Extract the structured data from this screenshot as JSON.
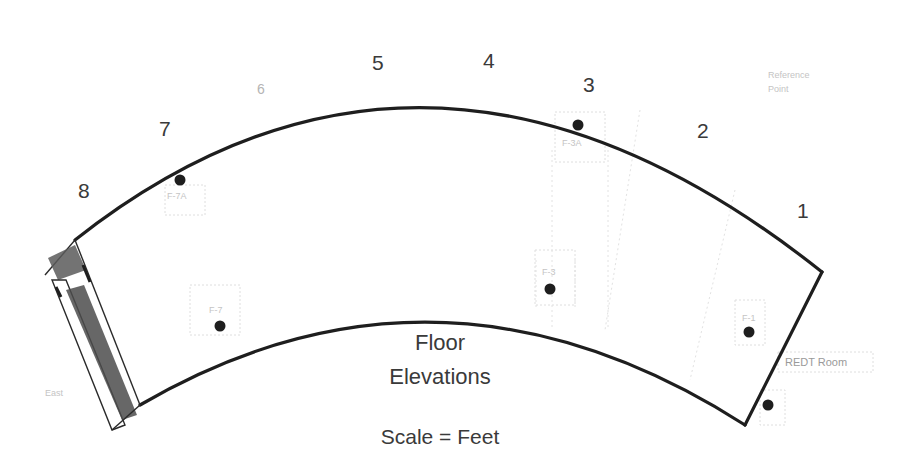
{
  "diagram": {
    "title_line1": "Floor",
    "title_line2": "Elevations",
    "scale_label": "Scale = Feet",
    "section_labels": [
      "1",
      "2",
      "3",
      "4",
      "5",
      "6",
      "7",
      "8"
    ],
    "points": [
      {
        "id": "F-1",
        "label": "F-1"
      },
      {
        "id": "F-3",
        "label": "F-3"
      },
      {
        "id": "F-3A",
        "label": "F-3A"
      },
      {
        "id": "F-7",
        "label": "F-7"
      },
      {
        "id": "F-7A",
        "label": "F-7A"
      },
      {
        "id": "ext",
        "label": ""
      }
    ],
    "annotations": {
      "room": "REDT Room",
      "left_end": "East",
      "top_right_1": "Reference",
      "top_right_2": "Point"
    },
    "colors": {
      "wall": "#1e1e1e",
      "text": "#3a3a3a",
      "faint": "#c4c4c4"
    }
  }
}
